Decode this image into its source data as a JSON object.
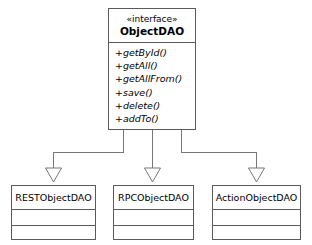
{
  "diagram": {
    "type": "uml-class-diagram",
    "background_color": "#ffffff",
    "line_color": "#5a5a5a",
    "relationship": "generalization"
  },
  "interface": {
    "stereotype": "«interface»",
    "name": "ObjectDAO",
    "operations": [
      "+getById()",
      "+getAll()",
      "+getAllFrom()",
      "+save()",
      "+delete()",
      "+addTo()"
    ]
  },
  "subclasses": [
    {
      "name": "RESTObjectDAO",
      "attributes": [],
      "methods": []
    },
    {
      "name": "RPCObjectDAO",
      "attributes": [],
      "methods": []
    },
    {
      "name": "ActionObjectDAO",
      "attributes": [],
      "methods": []
    }
  ]
}
